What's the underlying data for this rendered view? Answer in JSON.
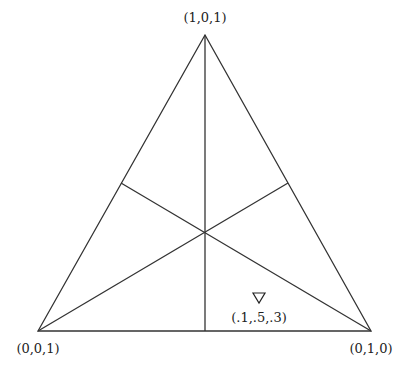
{
  "diagram": {
    "type": "simplex-triangle",
    "vertices": {
      "top": {
        "label": "(1,0,1)",
        "x": 205,
        "y": 35
      },
      "left": {
        "label": "(0,0,1)",
        "x": 38,
        "y": 331
      },
      "right": {
        "label": "(0,1,0)",
        "x": 371,
        "y": 331
      }
    },
    "point": {
      "marker": "▽",
      "label": "(.1,.5,.3)",
      "x": 259,
      "y": 298
    },
    "medians": true
  }
}
